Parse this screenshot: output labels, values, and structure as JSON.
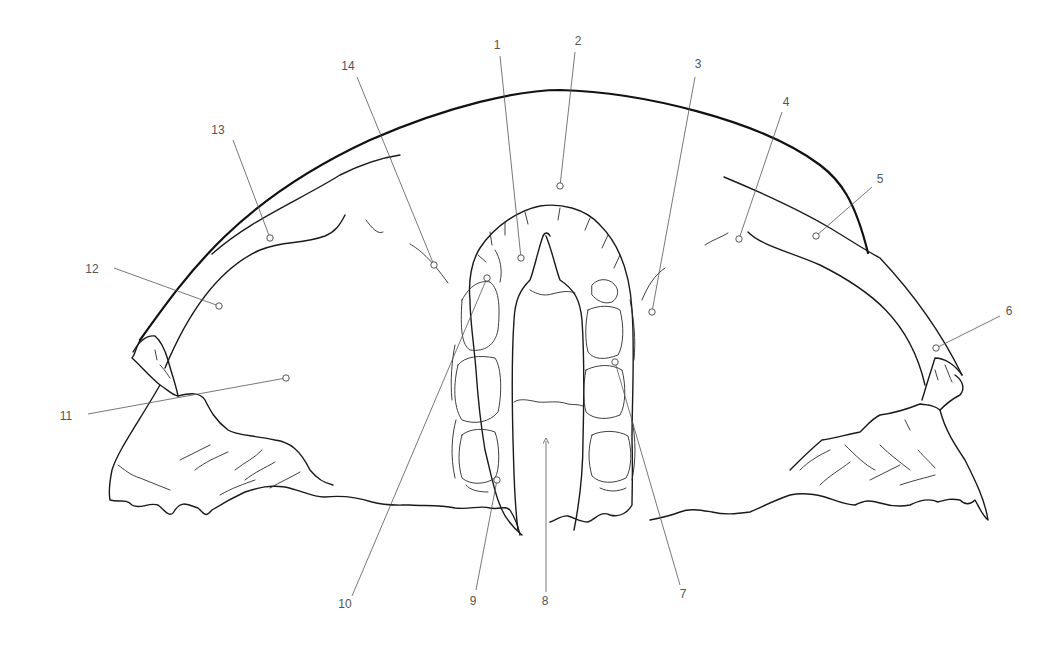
{
  "figure": {
    "type": "anatomical line drawing",
    "colors": {
      "line": "#111111",
      "leader": "#555555",
      "label": "#555555",
      "background": "#ffffff"
    }
  },
  "callouts": [
    {
      "number": "1",
      "label_x": 497,
      "label_y": 49,
      "line_from": [
        500,
        56
      ],
      "line_to": [
        521,
        258
      ],
      "marker": [
        521,
        258
      ]
    },
    {
      "number": "2",
      "label_x": 578,
      "label_y": 45,
      "line_from": [
        575,
        52
      ],
      "line_to": [
        560,
        186
      ],
      "marker": [
        560,
        186
      ]
    },
    {
      "number": "3",
      "label_x": 698,
      "label_y": 68,
      "line_from": [
        695,
        77
      ],
      "line_to": [
        652,
        312
      ],
      "marker": [
        652,
        312
      ]
    },
    {
      "number": "4",
      "label_x": 786,
      "label_y": 106,
      "line_from": [
        782,
        112
      ],
      "line_to": [
        739,
        239
      ],
      "marker": [
        739,
        239
      ]
    },
    {
      "number": "5",
      "label_x": 880,
      "label_y": 183,
      "line_from": [
        872,
        187
      ],
      "line_to": [
        816,
        236
      ],
      "marker": [
        816,
        236
      ]
    },
    {
      "number": "6",
      "label_x": 1009,
      "label_y": 315,
      "line_from": [
        1000,
        316
      ],
      "line_to": [
        936,
        348
      ],
      "marker": [
        936,
        348
      ]
    },
    {
      "number": "7",
      "label_x": 683,
      "label_y": 598,
      "line_from": [
        680,
        585
      ],
      "line_to": [
        615,
        362
      ],
      "marker": [
        615,
        362
      ]
    },
    {
      "number": "8",
      "label_x": 545,
      "label_y": 605,
      "line_from": [
        546,
        592
      ],
      "line_to": [
        546,
        441
      ],
      "arrow": true
    },
    {
      "number": "9",
      "label_x": 473,
      "label_y": 605,
      "line_from": [
        476,
        590
      ],
      "line_to": [
        497,
        480
      ],
      "marker": [
        497,
        480
      ]
    },
    {
      "number": "10",
      "label_x": 345,
      "label_y": 608,
      "line_from": [
        352,
        596
      ],
      "line_to": [
        487,
        278
      ],
      "marker": [
        487,
        278
      ]
    },
    {
      "number": "11",
      "label_x": 66,
      "label_y": 420,
      "line_from": [
        88,
        414
      ],
      "line_to": [
        286,
        378
      ],
      "marker": [
        286,
        378
      ]
    },
    {
      "number": "12",
      "label_x": 92,
      "label_y": 273,
      "line_from": [
        114,
        268
      ],
      "line_to": [
        219,
        306
      ],
      "marker": [
        219,
        306
      ]
    },
    {
      "number": "13",
      "label_x": 218,
      "label_y": 134,
      "line_from": [
        233,
        140
      ],
      "line_to": [
        270,
        238
      ],
      "marker": [
        270,
        238
      ]
    },
    {
      "number": "14",
      "label_x": 348,
      "label_y": 70,
      "line_from": [
        357,
        77
      ],
      "line_to": [
        434,
        265
      ],
      "marker": [
        434,
        265
      ]
    }
  ]
}
